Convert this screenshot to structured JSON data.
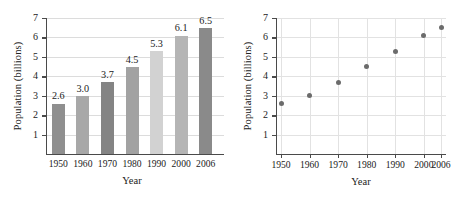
{
  "chart_data": [
    {
      "type": "bar",
      "title": "",
      "xlabel": "Year",
      "ylabel": "Population (billions)",
      "categories": [
        "1950",
        "1960",
        "1970",
        "1980",
        "1990",
        "2000",
        "2006"
      ],
      "values": [
        2.6,
        3.0,
        3.7,
        4.5,
        5.3,
        6.1,
        6.5
      ],
      "value_labels": [
        "2.6",
        "3.0",
        "3.7",
        "4.5",
        "5.3",
        "6.1",
        "6.5"
      ],
      "ylim": [
        0,
        7
      ],
      "yticks": [
        "1",
        "2",
        "3",
        "4",
        "5",
        "6",
        "7"
      ],
      "grid": "horizontal",
      "legend": "none",
      "bar_colors": [
        "#8f8f8f",
        "#a8a8a8",
        "#848484",
        "#a2a2a2",
        "#d2d2d2",
        "#b5b5b5",
        "#8a8a8a"
      ]
    },
    {
      "type": "scatter",
      "title": "",
      "xlabel": "Year",
      "ylabel": "Population (billions)",
      "x": [
        "1950",
        "1960",
        "1970",
        "1980",
        "1990",
        "2000",
        "2006"
      ],
      "values": [
        2.6,
        3.0,
        3.7,
        4.5,
        5.3,
        6.1,
        6.5
      ],
      "ylim": [
        0,
        7
      ],
      "yticks": [
        "1",
        "2",
        "3",
        "4",
        "5",
        "6",
        "7"
      ],
      "xticks": [
        "1950",
        "1960",
        "1970",
        "1980",
        "1990",
        "2000",
        "2006"
      ],
      "grid": "both",
      "legend": "none",
      "marker_color": "#6b6b6b"
    }
  ],
  "colors": {
    "axis": "#4a4a4a",
    "grid": "#dcdcdc",
    "text": "#222222",
    "marker": "#6b6b6b"
  }
}
